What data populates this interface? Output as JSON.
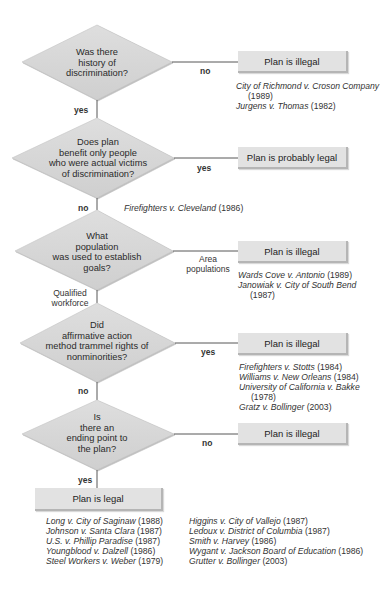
{
  "diagram": {
    "type": "flowchart",
    "colors": {
      "shape_fill": "#d6d6d6",
      "box_fill": "#e2e2e2",
      "line": "#444444"
    },
    "nodes": [
      {
        "id": "q1",
        "question": [
          "Was there",
          "history of",
          "discrimination?"
        ],
        "branch_right": {
          "label": "no",
          "outcome": "Plan is illegal",
          "cases": [
            {
              "name": "City of Richmond v. Croson Company",
              "year": "(1989)",
              "year_wrapped": true
            },
            {
              "name": "Jurgens v. Thomas",
              "year": "(1982)"
            }
          ]
        },
        "branch_down": {
          "label": "yes"
        }
      },
      {
        "id": "q2",
        "question": [
          "Does plan",
          "benefit only people",
          "who were actual victims",
          "of discrimination?"
        ],
        "branch_right": {
          "label": "yes",
          "outcome": "Plan is probably  legal",
          "cases": []
        },
        "branch_down": {
          "label": "no",
          "cases": [
            {
              "name": "Firefighters v. Cleveland",
              "year": "(1986)"
            }
          ]
        }
      },
      {
        "id": "q3",
        "question": [
          "What",
          "population",
          "was used to establish",
          "goals?"
        ],
        "branch_right": {
          "label": [
            "Area",
            "populations"
          ],
          "outcome": "Plan is illegal",
          "cases": [
            {
              "name": "Wards Cove v. Antonio",
              "year": "(1989)"
            },
            {
              "name": "Janowiak v. City of South Bend",
              "year": "(1987)",
              "year_wrapped": true
            }
          ]
        },
        "branch_down": {
          "label": [
            "Qualified",
            "workforce"
          ]
        }
      },
      {
        "id": "q4",
        "question": [
          "Did",
          "affirmative action",
          "method trammel rights of",
          "nonminorities?"
        ],
        "branch_right": {
          "label": "yes",
          "outcome": "Plan is illegal",
          "cases": [
            {
              "name": "Firefighters v. Stotts",
              "year": "(1984)"
            },
            {
              "name": "Williams v. New Orleans",
              "year": "(1984)"
            },
            {
              "name": "University of California v. Bakke",
              "year": "(1978)",
              "year_wrapped": true
            },
            {
              "name": "Gratz v. Bollinger",
              "year": "(2003)"
            }
          ]
        },
        "branch_down": {
          "label": "no"
        }
      },
      {
        "id": "q5",
        "question": [
          "Is",
          "there an",
          "ending point to",
          "the plan?"
        ],
        "branch_right": {
          "label": "no",
          "outcome": "Plan is illegal",
          "cases": []
        },
        "branch_down": {
          "label": "yes"
        }
      }
    ],
    "final": {
      "outcome": "Plan is legal",
      "cases_left": [
        {
          "name": "Long v. City of Saginaw",
          "year": "(1988)"
        },
        {
          "name": "Johnson v. Santa Clara",
          "year": "(1987)"
        },
        {
          "name": "U.S. v. Phillip Paradise",
          "year": "(1987)"
        },
        {
          "name": "Youngblood v. Dalzell",
          "year": "(1986)"
        },
        {
          "name": "Steel Workers v. Weber",
          "year": "(1979)"
        }
      ],
      "cases_right": [
        {
          "name": "Higgins v. City of Vallejo",
          "year": "(1987)"
        },
        {
          "name": "Ledoux v. District of Columbia",
          "year": "(1987)"
        },
        {
          "name": "Smith v. Harvey",
          "year": "(1986)"
        },
        {
          "name": "Wygant v. Jackson Board of Education",
          "year": "(1986)"
        },
        {
          "name": "Grutter v. Bollinger",
          "year": "(2003)"
        }
      ]
    }
  }
}
